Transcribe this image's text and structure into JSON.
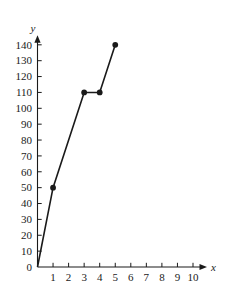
{
  "chart_data": {
    "type": "line",
    "title": "",
    "subtitle": "",
    "xlabel": "x",
    "ylabel": "y",
    "x": [
      0,
      1,
      3,
      4,
      5
    ],
    "values": [
      0,
      50,
      110,
      110,
      140
    ],
    "points": [
      {
        "x": 0,
        "y": 0,
        "marker": false
      },
      {
        "x": 1,
        "y": 50,
        "marker": true
      },
      {
        "x": 3,
        "y": 110,
        "marker": true
      },
      {
        "x": 4,
        "y": 110,
        "marker": true
      },
      {
        "x": 5,
        "y": 140,
        "marker": true
      }
    ],
    "xlim": [
      0,
      11
    ],
    "ylim": [
      0,
      145
    ],
    "x_ticks": [
      1,
      2,
      3,
      4,
      5,
      6,
      7,
      8,
      9,
      10
    ],
    "x_tick_labels": [
      "1",
      "2",
      "3",
      "4",
      "5",
      "6",
      "7",
      "8",
      "9",
      "10"
    ],
    "y_ticks": [
      0,
      10,
      20,
      30,
      40,
      50,
      60,
      70,
      80,
      90,
      100,
      110,
      120,
      130,
      140
    ],
    "y_tick_labels": [
      "0",
      "10",
      "20",
      "30",
      "40",
      "50",
      "60",
      "70",
      "80",
      "90",
      "100",
      "110",
      "120",
      "130",
      "140"
    ],
    "grid": false,
    "legend": null,
    "line_color": "#1a1a1a",
    "marker_color": "#1a1a1a",
    "background_color": "#ffffff",
    "annotations": []
  },
  "axes": {
    "x_axis_label": "x",
    "y_axis_label": "y"
  }
}
